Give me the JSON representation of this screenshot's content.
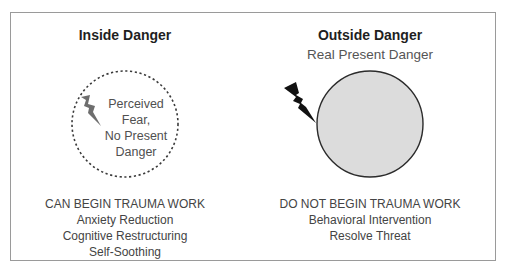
{
  "diagram": {
    "left": {
      "title": "Inside Danger",
      "circle_style": "dashed",
      "circle_label": [
        "Perceived",
        "Fear,",
        "No Present",
        "Danger"
      ],
      "bolt_icon": "lightning-bolt-gray",
      "heading": "CAN BEGIN TRAUMA WORK",
      "items": [
        "Anxiety Reduction",
        "Cognitive Restructuring",
        "Self-Soothing"
      ]
    },
    "right": {
      "title": "Outside Danger",
      "subtitle": "Real Present Danger",
      "circle_style": "solid-filled",
      "bolt_icon": "lightning-bolt-black",
      "heading": "DO NOT BEGIN TRAUMA WORK",
      "items": [
        "Behavioral Intervention",
        "Resolve Threat"
      ]
    },
    "colors": {
      "frame": "#9a9a9a",
      "filled_circle": "#dcdcdc",
      "circle_stroke": "#2b2b2b",
      "gray_bolt": "#6e6e6e",
      "black_bolt": "#111111"
    }
  }
}
